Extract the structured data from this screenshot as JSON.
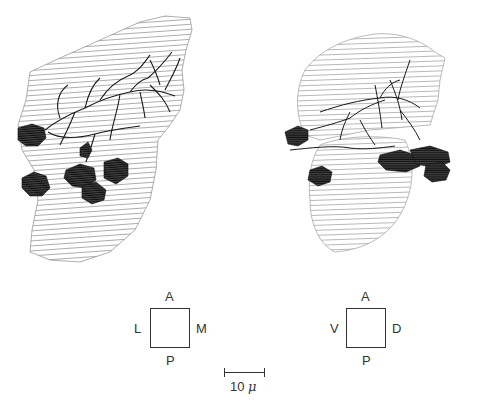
{
  "figure": {
    "panels": [
      {
        "id": "left",
        "description": "Serial-section reconstruction with hatched outline, branching processes and dark filled cell bodies",
        "orientation": {
          "top": "A",
          "bottom": "P",
          "left": "L",
          "right": "M"
        }
      },
      {
        "id": "right",
        "description": "Serial-section reconstruction with hatched outline, branching processes and dark filled cell bodies",
        "orientation": {
          "top": "A",
          "bottom": "P",
          "left": "V",
          "right": "D"
        }
      }
    ],
    "scale_bar": {
      "value": "10",
      "unit": "μ"
    },
    "colors": {
      "ink": "#222222",
      "hatch": "#8a8a8a",
      "fill": "#1a1a1a",
      "background": "#ffffff"
    }
  }
}
